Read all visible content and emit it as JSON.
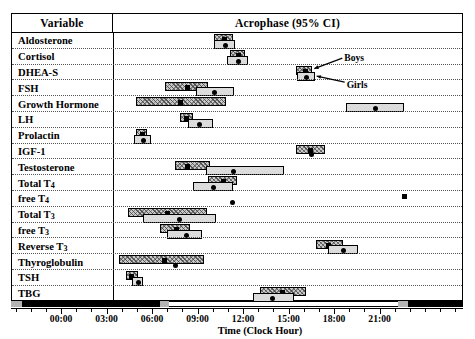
{
  "table": {
    "header_variable": "Variable",
    "header_acrophase": "Acrophase (95% CI)"
  },
  "legend": {
    "boys_label": "Boys",
    "girls_label": "Girls",
    "boys_style": "hatched-grey-box-with-square-marker",
    "girls_style": "light-grey-box-with-round-marker",
    "anchor_row": "DHEA-S"
  },
  "axis": {
    "title": "Time (Clock Hour)",
    "tick_labels": [
      "00:00",
      "03:00",
      "06:00",
      "09:00",
      "12:00",
      "15:00",
      "18:00",
      "21:00"
    ],
    "tick_hours": [
      0,
      3,
      6,
      9,
      12,
      15,
      18,
      21
    ],
    "range_hours": [
      -3.3,
      26.5
    ],
    "minor_tick_interval_hours": 1,
    "daynight_bar": {
      "description": "black = night (dark period), white = day (light period)",
      "segments": [
        {
          "from": -3.3,
          "to": -2.6,
          "shade": "dusk"
        },
        {
          "from": -2.6,
          "to": 6.5,
          "shade": "dark"
        },
        {
          "from": 6.5,
          "to": 7.1,
          "shade": "dusk"
        },
        {
          "from": 7.1,
          "to": 22.2,
          "shade": "light"
        },
        {
          "from": 22.2,
          "to": 22.9,
          "shade": "dusk"
        },
        {
          "from": 22.9,
          "to": 26.5,
          "shade": "dark"
        }
      ]
    }
  },
  "colors": {
    "boys_fill": "#c9c9c9",
    "girls_fill": "#dcdcdc",
    "marker": "#000000",
    "frame": "#000000",
    "row_separator": "#555555"
  },
  "chart_data": {
    "type": "bar",
    "title": "Acrophase (95% CI)",
    "xlabel": "Time (Clock Hour)",
    "ylabel": "Variable",
    "xlim": [
      -3.3,
      26.5
    ],
    "grid": true,
    "legend_position": "inline-callout",
    "orientation": "horizontal-interval",
    "units": "clock hour",
    "series": [
      {
        "name": "Boys",
        "marker": "square",
        "fill": "hatched grey"
      },
      {
        "name": "Girls",
        "marker": "circle",
        "fill": "light grey"
      }
    ],
    "categories": [
      "Aldosterone",
      "Cortisol",
      "DHEA-S",
      "FSH",
      "Growth Hormone",
      "LH",
      "Prolactin",
      "IGF-1",
      "Testosterone",
      "Total T4",
      "free T4",
      "Total T3",
      "free T3",
      "Reverse T3",
      "Thyroglobulin",
      "TSH",
      "TBG"
    ],
    "rows": [
      {
        "variable": "Aldosterone",
        "boys": {
          "acrophase": 6.1,
          "ci_low": 5.3,
          "ci_high": 6.9
        },
        "girls": {
          "acrophase": 6.2,
          "ci_low": 5.3,
          "ci_high": 7.1
        }
      },
      {
        "variable": "Cortisol",
        "boys": {
          "acrophase": 7.3,
          "ci_low": 6.7,
          "ci_high": 8.0
        },
        "girls": {
          "acrophase": 7.3,
          "ci_low": 6.4,
          "ci_high": 8.2
        }
      },
      {
        "variable": "DHEA-S",
        "boys": {
          "acrophase": 13.0,
          "ci_low": 12.3,
          "ci_high": 13.7
        },
        "girls": {
          "acrophase": 13.1,
          "ci_low": 12.4,
          "ci_high": 13.9
        }
      },
      {
        "variable": "FSH",
        "boys": {
          "acrophase": 3.0,
          "ci_low": 1.1,
          "ci_high": 4.8
        },
        "girls": {
          "acrophase": 5.3,
          "ci_low": 3.8,
          "ci_high": 7.0
        }
      },
      {
        "variable": "Growth Hormone",
        "boys": {
          "acrophase": 2.4,
          "ci_low": -1.3,
          "ci_high": 6.3
        },
        "girls": {
          "acrophase": 19.0,
          "ci_low": 16.6,
          "ci_high": 21.5
        }
      },
      {
        "variable": "LH",
        "boys": {
          "acrophase": 2.9,
          "ci_low": 2.4,
          "ci_high": 3.5
        },
        "girls": {
          "acrophase": 4.0,
          "ci_low": 3.1,
          "ci_high": 5.2
        }
      },
      {
        "variable": "Prolactin",
        "boys": {
          "acrophase": -0.9,
          "ci_low": -1.3,
          "ci_high": -0.4
        },
        "girls": {
          "acrophase": -0.8,
          "ci_low": -1.5,
          "ci_high": -0.1
        }
      },
      {
        "variable": "IGF-1",
        "boys": {
          "acrophase": 13.5,
          "ci_low": 12.3,
          "ci_high": 14.8
        },
        "girls": {
          "acrophase": 13.6,
          "ci_low": null,
          "ci_high": null
        }
      },
      {
        "variable": "Testosterone",
        "boys": {
          "acrophase": 3.0,
          "ci_low": 2.0,
          "ci_high": 5.0
        },
        "girls": {
          "acrophase": 6.9,
          "ci_low": 4.6,
          "ci_high": 11.3
        }
      },
      {
        "variable": "Total T4",
        "boys": {
          "acrophase": 6.0,
          "ci_low": 4.8,
          "ci_high": 7.3
        },
        "girls": {
          "acrophase": 5.2,
          "ci_low": 3.5,
          "ci_high": 6.9
        }
      },
      {
        "variable": "free T4",
        "boys": {
          "acrophase": 21.6,
          "ci_low": null,
          "ci_high": null
        },
        "girls": {
          "acrophase": 6.9,
          "ci_low": null,
          "ci_high": null
        }
      },
      {
        "variable": "Total T3",
        "boys": {
          "acrophase": 1.3,
          "ci_low": -2.0,
          "ci_high": 4.7
        },
        "girls": {
          "acrophase": 2.3,
          "ci_low": -0.7,
          "ci_high": 5.5
        }
      },
      {
        "variable": "free T3",
        "boys": {
          "acrophase": 2.0,
          "ci_low": 0.7,
          "ci_high": 3.3
        },
        "girls": {
          "acrophase": 2.9,
          "ci_low": 1.3,
          "ci_high": 4.3
        }
      },
      {
        "variable": "Reverse T3",
        "boys": {
          "acrophase": 15.0,
          "ci_low": 14.0,
          "ci_high": 16.3
        },
        "girls": {
          "acrophase": 16.3,
          "ci_low": 15.0,
          "ci_high": 17.6
        }
      },
      {
        "variable": "Thyroglobulin",
        "boys": {
          "acrophase": 1.0,
          "ci_low": -2.8,
          "ci_high": 4.5
        },
        "girls": {
          "acrophase": 2.0,
          "ci_low": null,
          "ci_high": null
        }
      },
      {
        "variable": "TSH",
        "boys": {
          "acrophase": -1.8,
          "ci_low": -2.2,
          "ci_high": -1.2
        },
        "girls": {
          "acrophase": -1.2,
          "ci_low": -1.7,
          "ci_high": -0.7
        }
      },
      {
        "variable": "TBG",
        "boys": {
          "acrophase": 11.1,
          "ci_low": 9.2,
          "ci_high": 13.2
        },
        "girls": {
          "acrophase": 10.2,
          "ci_low": 8.6,
          "ci_high": 12.1
        }
      }
    ]
  }
}
